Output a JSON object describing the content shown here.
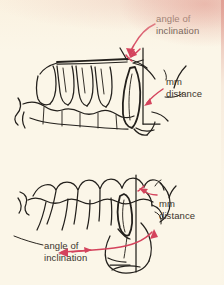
{
  "figure": {
    "background_color": "#fbf6e8",
    "ink_color": "#23201c",
    "annotation_color": "#d4435c",
    "text_color": "#3a342c",
    "paper_edge_color": "#de948a"
  },
  "panels": [
    {
      "id": "upper",
      "name": "upper-arch-diagram",
      "description": "Lateral line drawing of the maxillary (upper) arch with teeth, showing a tilted incisor against a vertical reference line",
      "labels": [
        {
          "id": "angle-of-inclination",
          "line1": "angle of",
          "line2": "inclination"
        },
        {
          "id": "mm-distance",
          "line1": "mm",
          "line2": "distance"
        }
      ]
    },
    {
      "id": "lower",
      "name": "lower-arch-diagram",
      "description": "Lateral line drawing of the mandibular (lower) arch with teeth, showing a tilted incisor against a vertical reference line",
      "labels": [
        {
          "id": "mm-distance",
          "line1": "mm",
          "line2": "distance"
        },
        {
          "id": "angle-of-inclination",
          "line1": "angle of",
          "line2": "inclination"
        }
      ]
    }
  ],
  "annotations": {
    "upper_angle_leader": "curved red leader arrow from the 'angle of inclination' text to the angle vertex at the incisor crown",
    "upper_mm_leader": "curved red leader arrow from the 'mm distance' text to the base of the vertical reference line",
    "lower_mm_leader": "curved red leader arrow from the 'mm distance' text to the incisor root area",
    "lower_angle_leader": "long red double-headed curved arrow spanning the angle of inclination at the lower incisor"
  }
}
